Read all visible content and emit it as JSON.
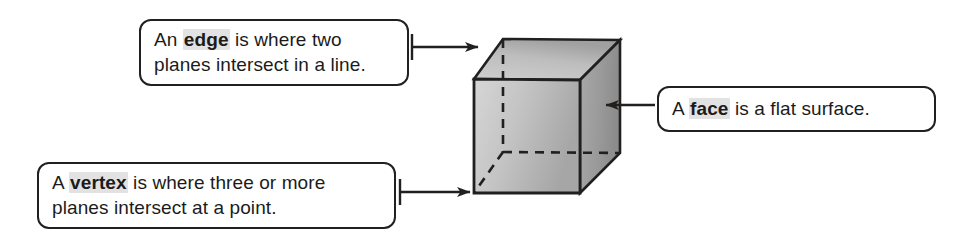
{
  "callouts": [
    {
      "id": "edge",
      "term": "edge",
      "text_before": "An ",
      "text_after_line1": " is where two",
      "line2": "planes intersect in a line.",
      "arrow_direction": "right",
      "points_to": "top-left edge of cube"
    },
    {
      "id": "face",
      "term": "face",
      "text_before": "A ",
      "text_after_line1": " is a flat surface.",
      "line2": "",
      "arrow_direction": "left",
      "points_to": "right face of cube"
    },
    {
      "id": "vertex",
      "term": "vertex",
      "text_before": "A ",
      "text_after_line1": " is where three or more",
      "line2": "planes intersect at a point.",
      "arrow_direction": "right",
      "points_to": "bottom-left vertex of cube"
    }
  ],
  "cube": {
    "front_face_label": "front-face",
    "top_face_label": "top-face",
    "right_face_label": "right-face",
    "hidden_edges_style": "dashed",
    "visible_edges_style": "solid"
  },
  "colors": {
    "outline": "#221f1f",
    "box_border": "#221f1f",
    "box_fill": "#ffffff",
    "term_highlight": "#e2e2e2",
    "text": "#1b1b1b",
    "front_face_light": "#d2d2d2",
    "front_face_dark": "#a8a8a8",
    "top_face_light": "#c9c9c9",
    "top_face_dark": "#a3a3a3",
    "right_face_light": "#a5a5a5",
    "right_face_dark": "#8a8a8a"
  }
}
